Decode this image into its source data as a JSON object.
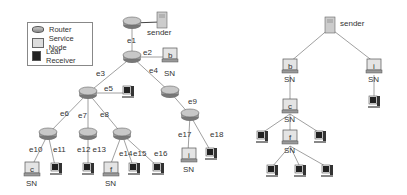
{
  "legend": {
    "items": [
      {
        "icon": "router-icon",
        "label": "Router"
      },
      {
        "icon": "service-node-icon",
        "label": "Service Node"
      },
      {
        "icon": "leaf-receiver-icon",
        "label": "Leaf Receiver"
      }
    ]
  },
  "left_tree": {
    "sender_label": "sender",
    "sn_label": "SN",
    "edges": [
      "e1",
      "e2",
      "e3",
      "e4",
      "e5",
      "e6",
      "e7",
      "e8",
      "e9",
      "e10",
      "e11",
      "e12 e13",
      "e14",
      "e15",
      "e16",
      "e17",
      "e18"
    ],
    "service_nodes": [
      "b",
      "c",
      "f",
      "i"
    ]
  },
  "right_tree": {
    "sender_label": "sender",
    "sn_label": "SN",
    "service_nodes": [
      "b",
      "i",
      "c",
      "f"
    ]
  }
}
